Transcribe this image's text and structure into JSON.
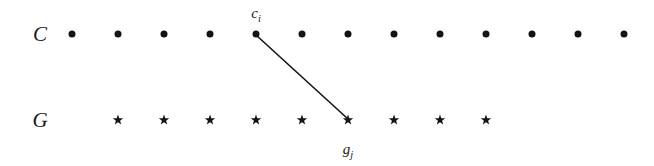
{
  "figure": {
    "title": "",
    "background_color": "#ffffff",
    "ink_color": "#141414",
    "width": 654,
    "height": 166
  },
  "rows": [
    {
      "id": "c-row",
      "label": "C",
      "marker": "dot",
      "label_x": 40,
      "y": 34,
      "count": 13,
      "start_x": 72,
      "spacing": 46,
      "marker_size": 7,
      "points_x": [
        72,
        118,
        164,
        210,
        256,
        302,
        348,
        394,
        440,
        486,
        532,
        578,
        624
      ]
    },
    {
      "id": "g-row",
      "label": "G",
      "marker": "star",
      "label_x": 40,
      "y": 120,
      "count": 9,
      "start_x": 118,
      "spacing": 46,
      "marker_size": 11,
      "points_x": [
        118,
        164,
        210,
        256,
        302,
        348,
        394,
        440,
        486
      ]
    }
  ],
  "annotations": {
    "c_label": {
      "base": "c",
      "subscript": "i",
      "x": 256,
      "y": 18,
      "anchor_point_index": 4,
      "anchor_row": "c-row"
    },
    "g_label": {
      "base": "g",
      "subscript": "j",
      "x": 348,
      "y": 154,
      "anchor_point_index": 5,
      "anchor_row": "g-row"
    }
  },
  "edges": [
    {
      "id": "ci-gj-edge",
      "from_row": "c-row",
      "from_index": 4,
      "to_row": "g-row",
      "to_index": 5,
      "x1": 256,
      "y1": 35,
      "x2": 348,
      "y2": 119,
      "stroke": "#141414",
      "stroke_width": 1.6
    }
  ]
}
